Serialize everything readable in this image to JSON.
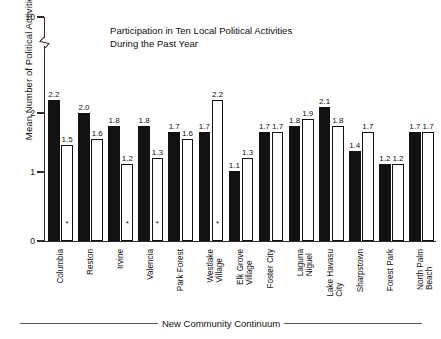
{
  "chart_data": {
    "type": "bar",
    "title": "Participation in Ten Local Political Activities During the Past Year",
    "title_lines": [
      "Participation in Ten Local Political Activities",
      "During the Past Year"
    ],
    "xlabel": "New Community Continuum",
    "ylabel": "Mean Number of Political Activities",
    "ylim": [
      0,
      2.6
    ],
    "yticks": [
      0,
      1,
      2,
      10
    ],
    "ytick_labels": [
      "0",
      "1",
      "2",
      "10"
    ],
    "axis_break": true,
    "axis_break_between": [
      2,
      10
    ],
    "grid": false,
    "legend": "none",
    "categories": [
      "Columbia",
      "Reston",
      "Irvine",
      "Valencia",
      "Park Forest",
      "Westlake Village",
      "Elk Grove Village",
      "Foster City",
      "Laguna Niguel",
      "Lake Havasu City",
      "Sharpstown",
      "Forest Park",
      "North Palm Beach"
    ],
    "category_lines": [
      [
        "Columbia"
      ],
      [
        "Reston"
      ],
      [
        "Irvine"
      ],
      [
        "Valencia"
      ],
      [
        "Park Forest"
      ],
      [
        "Westlake",
        "Village"
      ],
      [
        "Elk Grove",
        "Village"
      ],
      [
        "Foster City"
      ],
      [
        "Laguna",
        "Niguel"
      ],
      [
        "Lake Havasu",
        "City"
      ],
      [
        "Sharpstown"
      ],
      [
        "Forest Park"
      ],
      [
        "North Palm",
        "Beach"
      ]
    ],
    "series": [
      {
        "name": "new-community",
        "style": "filled-black",
        "values": [
          2.2,
          2.0,
          1.8,
          1.8,
          1.7,
          1.7,
          1.1,
          1.7,
          1.8,
          2.1,
          1.4,
          1.2,
          1.7
        ]
      },
      {
        "name": "paired-conventional-community",
        "style": "open-white",
        "values": [
          1.5,
          1.6,
          1.2,
          1.3,
          1.6,
          2.2,
          1.3,
          1.7,
          1.9,
          1.8,
          1.7,
          1.2,
          1.7
        ]
      }
    ],
    "value_labels_series1": [
      "2.2",
      "2.0",
      "1.8",
      "1.8",
      "1.7",
      "1.7",
      "1.1",
      "1.7",
      "1.8",
      "2.1",
      "1.4",
      "1.2",
      "1.7"
    ],
    "value_labels_series2": [
      "1.5",
      "1.6",
      "1.2",
      "1.3",
      "1.6",
      "2.2",
      "1.3",
      "1.7",
      "1.9",
      "1.8",
      "1.7",
      "1.2",
      "1.7"
    ],
    "asterisk_marker": "*",
    "asterisk_on_categories": [
      "Columbia",
      "Irvine",
      "Valencia",
      "Westlake Village"
    ],
    "colors": {
      "series1": "#111111",
      "series2": "#ffffff",
      "outline": "#111111",
      "axis": "#2b2b2b",
      "background": "#ffffff"
    }
  }
}
